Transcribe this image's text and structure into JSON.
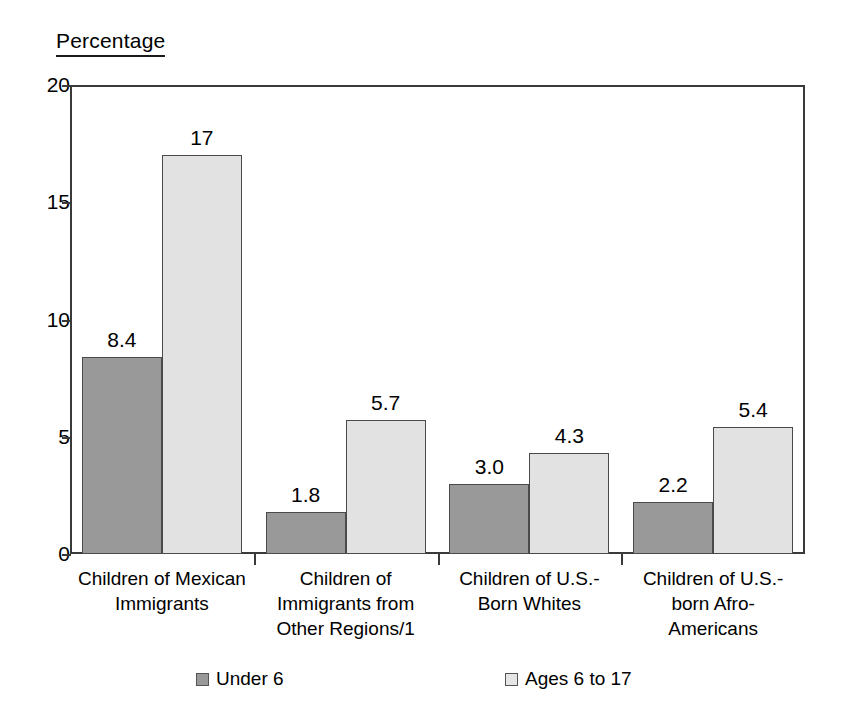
{
  "chart_data": {
    "type": "bar",
    "title": "Percentage",
    "xlabel": "",
    "ylabel": "Percentage",
    "ylim": [
      0,
      20
    ],
    "yticks": [
      0,
      5,
      10,
      15,
      20
    ],
    "ytick_labels": [
      "0",
      "5",
      "10",
      "15",
      "20"
    ],
    "grid": false,
    "legend_position": "bottom",
    "categories": [
      "Children of Mexican\nImmigrants",
      "Children of\nImmigrants from\nOther Regions/1",
      "Children of U.S.-\nBorn Whites",
      "Children of U.S.-\nborn Afro-\nAmericans"
    ],
    "series": [
      {
        "name": "Under 6",
        "color": "#999999",
        "values": [
          8.4,
          1.8,
          3.0,
          2.2
        ],
        "labels": [
          "8.4",
          "1.8",
          "3.0",
          "2.2"
        ]
      },
      {
        "name": "Ages 6 to 17",
        "color": "#e2e2e2",
        "values": [
          17,
          5.7,
          4.3,
          5.4
        ],
        "labels": [
          "17",
          "5.7",
          "4.3",
          "5.4"
        ]
      }
    ]
  },
  "legend": {
    "items": [
      {
        "label": "Under 6",
        "swatch": "legend-swatch-under-6"
      },
      {
        "label": "Ages 6 to 17",
        "swatch": "legend-swatch-ages-6-to-17"
      }
    ]
  },
  "colors": {
    "series_under_6": "#999999",
    "series_ages_6_to_17": "#e2e2e2",
    "axis": "#3a3a3a",
    "text": "#000000",
    "background": "#ffffff"
  }
}
